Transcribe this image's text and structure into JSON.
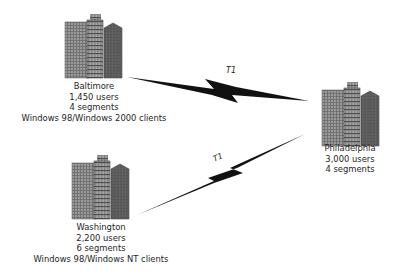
{
  "diagram": {
    "type": "network-topology",
    "sites": [
      {
        "id": "baltimore",
        "name": "Baltimore",
        "users": "1,450 users",
        "segments": "4 segments",
        "clients": "Windows 98/Windows 2000 clients",
        "icon": "office-buildings-icon"
      },
      {
        "id": "washington",
        "name": "Washington",
        "users": "2,200 users",
        "segments": "6 segments",
        "clients": "Windows 98/Windows NT clients",
        "icon": "office-buildings-icon"
      },
      {
        "id": "philadelphia",
        "name": "Philadelphia",
        "users": "3,000 users",
        "segments": "4 segments",
        "icon": "office-buildings-icon"
      }
    ],
    "links": [
      {
        "from": "baltimore",
        "to": "philadelphia",
        "label": "T1",
        "icon": "lightning-bolt-icon"
      },
      {
        "from": "washington",
        "to": "philadelphia",
        "label": "T1",
        "icon": "lightning-bolt-icon"
      }
    ],
    "colors": {
      "building_light": "#8c8c8c",
      "building_mid": "#6e6e6e",
      "building_dark": "#555555",
      "window_line": "#3a3a3a",
      "bolt": "#111111"
    }
  }
}
